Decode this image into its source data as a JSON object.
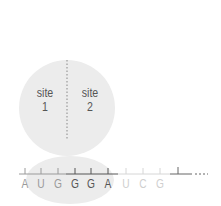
{
  "diagram": {
    "ribosome": {
      "large_subunit": {
        "color": "#ececec"
      },
      "small_subunit": {
        "color": "#ececec"
      },
      "divider": {
        "style": "dotted",
        "color": "#888888"
      },
      "sites": [
        {
          "line1": "site",
          "line2": "1"
        },
        {
          "line1": "site",
          "line2": "2"
        }
      ]
    },
    "mrna": {
      "bases": [
        "A",
        "U",
        "G",
        "G",
        "G",
        "A",
        "U",
        "C",
        "G"
      ],
      "base_colors": [
        "#9a9a9a",
        "#9a9a9a",
        "#9a9a9a",
        "#555555",
        "#555555",
        "#555555",
        "#cfcfcf",
        "#cfcfcf",
        "#cfcfcf"
      ],
      "continuation": "..."
    }
  }
}
